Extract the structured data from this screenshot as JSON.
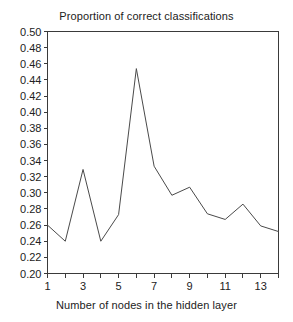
{
  "chart_data": {
    "type": "line",
    "title": "Proportion of correct classifications",
    "xlabel": "Number of nodes in the hidden layer",
    "ylabel": "",
    "x": [
      1,
      2,
      3,
      4,
      5,
      6,
      7,
      8,
      9,
      10,
      11,
      12,
      13,
      14
    ],
    "values": [
      0.26,
      0.24,
      0.329,
      0.24,
      0.273,
      0.454,
      0.333,
      0.297,
      0.307,
      0.274,
      0.267,
      0.286,
      0.259,
      0.252
    ],
    "series": [
      {
        "name": "Proportion of correct classifications",
        "values": [
          0.26,
          0.24,
          0.329,
          0.24,
          0.273,
          0.454,
          0.333,
          0.297,
          0.307,
          0.274,
          0.267,
          0.286,
          0.259,
          0.252
        ]
      }
    ],
    "xlim": [
      1,
      14
    ],
    "ylim": [
      0.2,
      0.5
    ],
    "ytick_labels": [
      "0.50",
      "0.48",
      "0.46",
      "0.44",
      "0.42",
      "0.40",
      "0.38",
      "0.36",
      "0.34",
      "0.32",
      "0.30",
      "0.28",
      "0.26",
      "0.24",
      "0.22",
      "0.20"
    ],
    "ytick_values": [
      0.5,
      0.48,
      0.46,
      0.44,
      0.42,
      0.4,
      0.38,
      0.36,
      0.34,
      0.32,
      0.3,
      0.28,
      0.26,
      0.24,
      0.22,
      0.2
    ],
    "xtick_labels": [
      "1",
      "3",
      "5",
      "7",
      "9",
      "11",
      "13"
    ],
    "xtick_values": [
      1,
      3,
      5,
      7,
      9,
      11,
      13
    ],
    "xtick_minor_values": [
      2,
      4,
      6,
      8,
      10,
      12,
      14
    ],
    "grid": false,
    "legend": false,
    "line_color": "#4a4a4a",
    "axis_color": "#3a3a3a",
    "background_color": "#ffffff"
  }
}
